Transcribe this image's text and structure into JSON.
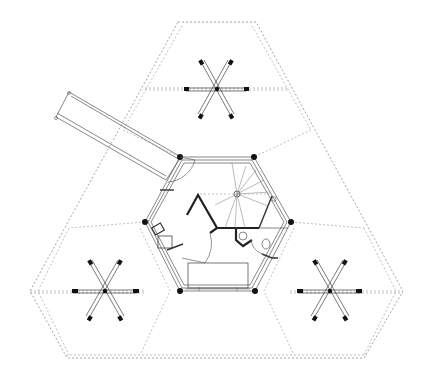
{
  "drawing": {
    "type": "architectural floor plan",
    "description": "Hexagonal pavilion with three radiating star-shaped foundation supports inside a large dashed truncated triangle, with an angled access ramp",
    "colors": {
      "background": "#ffffff",
      "line": "#222222",
      "dashed": "#9a9a9a"
    },
    "elements": {
      "outer_footprint": "truncated triangle (dashed)",
      "core": "hexagon",
      "supports": [
        "top",
        "bottom-left",
        "bottom-right"
      ],
      "ramp": "angled walkway upper-left",
      "rooms": [
        "entry",
        "spiral stair",
        "bathroom",
        "kitchen counter",
        "bedroom"
      ]
    }
  }
}
